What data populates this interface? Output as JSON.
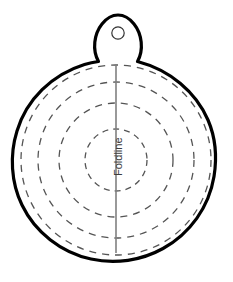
{
  "document": {
    "title": "Circle Ornament Pattern Template",
    "type": "sewing-pattern-template",
    "background_color": "#ffffff"
  },
  "labels": {
    "foldline": "Foldline"
  },
  "colors": {
    "outline": "#000000",
    "dashed_guide": "#555555",
    "foldline_stroke": "#808080",
    "hole_stroke": "#333333",
    "fill": "#ffffff",
    "text": "#3c3c3c"
  },
  "geometry": {
    "canvas": {
      "width": 233,
      "height": 282
    },
    "body_circle": {
      "cx": 116,
      "cy": 160,
      "r": 106,
      "stroke_width": 3.2
    },
    "hanger_tab": {
      "hole": {
        "cx": 118,
        "cy": 33,
        "r": 6.2,
        "stroke_width": 1.2
      },
      "top_y": 15
    },
    "foldline": {
      "x": 116,
      "y1": 64,
      "y2": 253,
      "stroke_width": 1.6
    },
    "dashed_circles": [
      {
        "name": "ring-1-innermost",
        "cx": 116,
        "cy": 160,
        "r": 31,
        "dash": "6 5",
        "stroke_width": 1.3
      },
      {
        "name": "ring-2",
        "cx": 116,
        "cy": 160,
        "r": 57,
        "dash": "7 6",
        "stroke_width": 1.3
      },
      {
        "name": "ring-3",
        "cx": 116,
        "cy": 160,
        "r": 78,
        "dash": "7 6",
        "stroke_width": 1.3
      },
      {
        "name": "ring-4-outermost",
        "cx": 116,
        "cy": 160,
        "r": 95,
        "dash": "7 6",
        "stroke_width": 1.3
      }
    ],
    "foldline_label": {
      "x": 113,
      "y": 176,
      "rotation_deg": -90
    }
  }
}
